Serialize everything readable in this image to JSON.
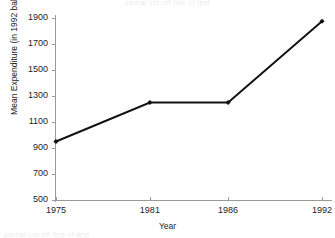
{
  "figure": {
    "background": "#ffffff",
    "axis_color": "#9a9a9a",
    "series_color": "#111111"
  },
  "artifacts": {
    "top_text": "partial cut-off line of text",
    "bottom_text": "partial cut-off line of text"
  },
  "axes": {
    "ylabel": "Mean Expenditure (in 1992 baht)",
    "xlabel": "Year",
    "yticks": [
      "1900",
      "1700",
      "1500",
      "1300",
      "1100",
      "900",
      "700",
      "500"
    ],
    "xticks": [
      "1975",
      "1981",
      "1986",
      "1992"
    ]
  },
  "chart_data": {
    "type": "line",
    "title": "",
    "xlabel": "Year",
    "ylabel": "Mean Expenditure (in 1992 baht)",
    "categories": [
      "1975",
      "1981",
      "1986",
      "1992"
    ],
    "values": [
      950,
      1250,
      1250,
      1875
    ],
    "series": [
      {
        "name": "Mean Expenditure",
        "values": [
          950,
          1250,
          1250,
          1875
        ],
        "color": "#111111",
        "marker": "diamond"
      }
    ],
    "ylim": [
      500,
      1900
    ],
    "ytick_step": 200,
    "grid": false,
    "legend": false,
    "legend_position": "none"
  }
}
